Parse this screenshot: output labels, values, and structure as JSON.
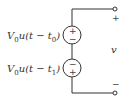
{
  "diagram": {
    "type": "circuit",
    "sources": [
      {
        "id": "source-1",
        "label": {
          "prefix": "V",
          "prefix_sub": "0",
          "func": "u(t − t",
          "func_sub": "0",
          "suffix": ")"
        },
        "polarity_top": "+",
        "polarity_bottom": "−"
      },
      {
        "id": "source-2",
        "label": {
          "prefix": "V",
          "prefix_sub": "0",
          "func": "u(t − t",
          "func_sub": "1",
          "suffix": ")"
        },
        "polarity_top": "−",
        "polarity_bottom": "+"
      }
    ],
    "output": {
      "voltage_label": "v",
      "terminal_top_sign": "+",
      "terminal_bottom_sign": "−"
    },
    "colors": {
      "wire": "#333333",
      "text": "#333333",
      "background": "#ffffff"
    }
  }
}
